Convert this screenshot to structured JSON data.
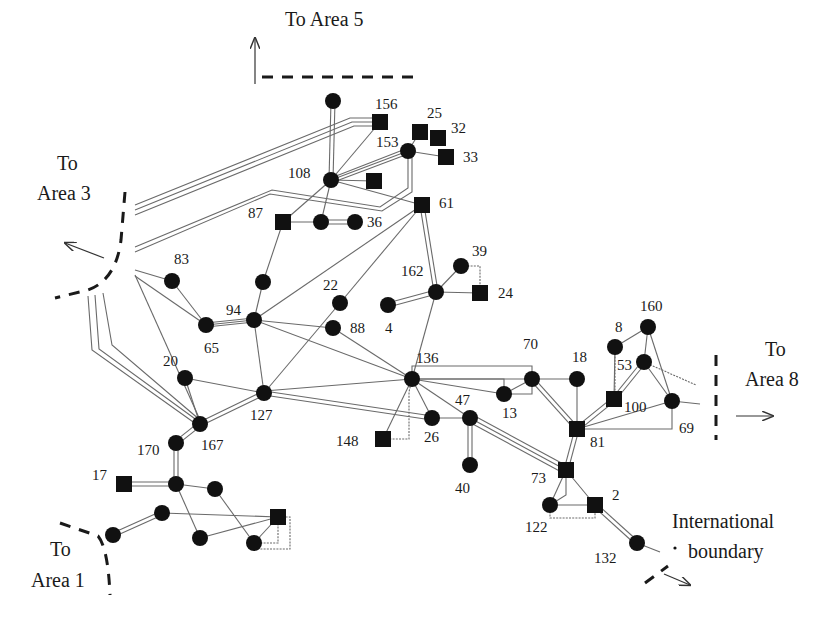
{
  "diagram": {
    "colors": {
      "node": "#111111",
      "line": "#6a6a6a",
      "boundary": "#1a1a1a"
    },
    "areas": [
      {
        "id": "area5",
        "label": "To Area 5",
        "x": 285,
        "y": 26
      },
      {
        "id": "area3",
        "line1": "To",
        "line2": "Area 3",
        "x": 70,
        "y1": 170,
        "y2": 200
      },
      {
        "id": "area8",
        "line1": "To",
        "line2": "Area 8",
        "x": 780,
        "y1": 355,
        "y2": 385
      },
      {
        "id": "area1",
        "line1": "To",
        "line2": "Area 1",
        "x": 65,
        "y1": 555,
        "y2": 585
      },
      {
        "id": "intl",
        "line1": "International",
        "line2": "boundary",
        "x": 765,
        "y1": 528,
        "y2": 558
      }
    ],
    "nodes": [
      {
        "id": "n-top",
        "label": "",
        "shape": "circle",
        "x": 333,
        "y": 101
      },
      {
        "id": "156",
        "label": "156",
        "shape": "square",
        "x": 380,
        "y": 122,
        "lx": 375,
        "ly": 109
      },
      {
        "id": "25",
        "label": "25",
        "shape": "square",
        "x": 420,
        "y": 132,
        "lx": 427,
        "ly": 118
      },
      {
        "id": "32",
        "label": "32",
        "shape": "square",
        "x": 438,
        "y": 138,
        "lx": 451,
        "ly": 133
      },
      {
        "id": "33",
        "label": "33",
        "shape": "square",
        "x": 446,
        "y": 157,
        "lx": 463,
        "ly": 162
      },
      {
        "id": "153",
        "label": "153",
        "shape": "circle",
        "x": 408,
        "y": 151,
        "lx": 376,
        "ly": 147
      },
      {
        "id": "108",
        "label": "108",
        "shape": "circle",
        "x": 331,
        "y": 180,
        "lx": 288,
        "ly": 178
      },
      {
        "id": "sq-108",
        "label": "",
        "shape": "square",
        "x": 374,
        "y": 181
      },
      {
        "id": "61",
        "label": "61",
        "shape": "square",
        "x": 422,
        "y": 205,
        "lx": 439,
        "ly": 208
      },
      {
        "id": "87",
        "label": "87",
        "shape": "square",
        "x": 283,
        "y": 222,
        "lx": 248,
        "ly": 218
      },
      {
        "id": "n-mid36",
        "label": "",
        "shape": "circle",
        "x": 321,
        "y": 222
      },
      {
        "id": "36",
        "label": "36",
        "shape": "circle",
        "x": 355,
        "y": 222,
        "lx": 367,
        "ly": 227
      },
      {
        "id": "83",
        "label": "83",
        "shape": "circle",
        "x": 172,
        "y": 281,
        "lx": 174,
        "ly": 264
      },
      {
        "id": "n-94top",
        "label": "",
        "shape": "circle",
        "x": 263,
        "y": 282
      },
      {
        "id": "94",
        "label": "94",
        "shape": "circle",
        "x": 254,
        "y": 320,
        "lx": 226,
        "ly": 315
      },
      {
        "id": "65",
        "label": "65",
        "shape": "circle",
        "x": 206,
        "y": 325,
        "lx": 204,
        "ly": 353
      },
      {
        "id": "22",
        "label": "22",
        "shape": "circle",
        "x": 340,
        "y": 303,
        "lx": 323,
        "ly": 290
      },
      {
        "id": "88",
        "label": "88",
        "shape": "circle",
        "x": 333,
        "y": 328,
        "lx": 350,
        "ly": 333
      },
      {
        "id": "39",
        "label": "39",
        "shape": "circle",
        "x": 461,
        "y": 266,
        "lx": 472,
        "ly": 256
      },
      {
        "id": "162",
        "label": "162",
        "shape": "circle",
        "x": 436,
        "y": 292,
        "lx": 401,
        "ly": 276
      },
      {
        "id": "24",
        "label": "24",
        "shape": "square",
        "x": 480,
        "y": 293,
        "lx": 498,
        "ly": 298
      },
      {
        "id": "4",
        "label": "4",
        "shape": "circle",
        "x": 388,
        "y": 305,
        "lx": 385,
        "ly": 333
      },
      {
        "id": "160",
        "label": "160",
        "shape": "circle",
        "x": 648,
        "y": 327,
        "lx": 640,
        "ly": 311
      },
      {
        "id": "8",
        "label": "8",
        "shape": "circle",
        "x": 615,
        "y": 347,
        "lx": 615,
        "ly": 332
      },
      {
        "id": "53",
        "label": "53",
        "shape": "circle",
        "x": 644,
        "y": 362,
        "lx": 617,
        "ly": 370
      },
      {
        "id": "20",
        "label": "20",
        "shape": "circle",
        "x": 185,
        "y": 378,
        "lx": 163,
        "ly": 366
      },
      {
        "id": "136",
        "label": "136",
        "shape": "circle",
        "x": 412,
        "y": 379,
        "lx": 416,
        "ly": 363
      },
      {
        "id": "70",
        "label": "70",
        "shape": "circle",
        "x": 532,
        "y": 379,
        "lx": 523,
        "ly": 349
      },
      {
        "id": "18",
        "label": "18",
        "shape": "circle",
        "x": 577,
        "y": 379,
        "lx": 572,
        "ly": 362
      },
      {
        "id": "13",
        "label": "13",
        "shape": "circle",
        "x": 504,
        "y": 394,
        "lx": 502,
        "ly": 418
      },
      {
        "id": "100",
        "label": "100",
        "shape": "square",
        "x": 614,
        "y": 399,
        "lx": 624,
        "ly": 412
      },
      {
        "id": "69",
        "label": "69",
        "shape": "circle",
        "x": 672,
        "y": 401,
        "lx": 679,
        "ly": 433
      },
      {
        "id": "127",
        "label": "127",
        "shape": "circle",
        "x": 264,
        "y": 393,
        "lx": 250,
        "ly": 420
      },
      {
        "id": "47",
        "label": "47",
        "shape": "circle",
        "x": 470,
        "y": 418,
        "lx": 455,
        "ly": 405
      },
      {
        "id": "26",
        "label": "26",
        "shape": "circle",
        "x": 432,
        "y": 418,
        "lx": 424,
        "ly": 442
      },
      {
        "id": "167",
        "label": "167",
        "shape": "circle",
        "x": 200,
        "y": 424,
        "lx": 201,
        "ly": 450
      },
      {
        "id": "81",
        "label": "81",
        "shape": "square",
        "x": 577,
        "y": 429,
        "lx": 590,
        "ly": 447
      },
      {
        "id": "148",
        "label": "148",
        "shape": "square",
        "x": 383,
        "y": 439,
        "lx": 336,
        "ly": 446
      },
      {
        "id": "170",
        "label": "170",
        "shape": "circle",
        "x": 176,
        "y": 443,
        "lx": 137,
        "ly": 455
      },
      {
        "id": "40",
        "label": "40",
        "shape": "circle",
        "x": 470,
        "y": 465,
        "lx": 455,
        "ly": 493
      },
      {
        "id": "73",
        "label": "73",
        "shape": "square",
        "x": 566,
        "y": 470,
        "lx": 531,
        "ly": 483
      },
      {
        "id": "17",
        "label": "17",
        "shape": "square",
        "x": 124,
        "y": 484,
        "lx": 92,
        "ly": 480
      },
      {
        "id": "n-17r",
        "label": "",
        "shape": "circle",
        "x": 176,
        "y": 484
      },
      {
        "id": "n-17rr",
        "label": "",
        "shape": "circle",
        "x": 215,
        "y": 489
      },
      {
        "id": "122",
        "label": "122",
        "shape": "circle",
        "x": 550,
        "y": 505,
        "lx": 525,
        "ly": 532
      },
      {
        "id": "2",
        "label": "2",
        "shape": "square",
        "x": 595,
        "y": 505,
        "lx": 612,
        "ly": 500
      },
      {
        "id": "n-a1",
        "label": "",
        "shape": "circle",
        "x": 162,
        "y": 513
      },
      {
        "id": "sq-a1",
        "label": "",
        "shape": "square",
        "x": 278,
        "y": 517
      },
      {
        "id": "n-a1l",
        "label": "",
        "shape": "circle",
        "x": 113,
        "y": 535
      },
      {
        "id": "n-a1b",
        "label": "",
        "shape": "circle",
        "x": 200,
        "y": 538
      },
      {
        "id": "n-a1br",
        "label": "",
        "shape": "circle",
        "x": 254,
        "y": 543
      },
      {
        "id": "132",
        "label": "132",
        "shape": "circle",
        "x": 637,
        "y": 543,
        "lx": 594,
        "ly": 563
      }
    ],
    "edges_single": [
      [
        "108",
        "153"
      ],
      [
        "108",
        "156"
      ],
      [
        "108",
        "61"
      ],
      [
        "108",
        "87"
      ],
      [
        "108",
        "n-mid36"
      ],
      [
        "108",
        "sq-108"
      ],
      [
        "153",
        "25"
      ],
      [
        "153",
        "33"
      ],
      [
        "87",
        "n-mid36"
      ],
      [
        "87",
        "n-94top"
      ],
      [
        "61",
        "94"
      ],
      [
        "61",
        "22"
      ],
      [
        "94",
        "88"
      ],
      [
        "94",
        "136"
      ],
      [
        "94",
        "127"
      ],
      [
        "94",
        "n-94top"
      ],
      [
        "83",
        "65"
      ],
      [
        "65",
        "94"
      ],
      [
        "22",
        "127"
      ],
      [
        "88",
        "136"
      ],
      [
        "162",
        "39"
      ],
      [
        "162",
        "24"
      ],
      [
        "162",
        "136"
      ],
      [
        "20",
        "127"
      ],
      [
        "20",
        "167"
      ],
      [
        "136",
        "26"
      ],
      [
        "136",
        "47"
      ],
      [
        "136",
        "13"
      ],
      [
        "136",
        "70"
      ],
      [
        "26",
        "47"
      ],
      [
        "70",
        "18"
      ],
      [
        "70",
        "13"
      ],
      [
        "18",
        "81"
      ],
      [
        "8",
        "160"
      ],
      [
        "8",
        "100"
      ],
      [
        "160",
        "53"
      ],
      [
        "160",
        "69"
      ],
      [
        "53",
        "69"
      ],
      [
        "81",
        "69"
      ],
      [
        "73",
        "2"
      ],
      [
        "73",
        "122"
      ],
      [
        "122",
        "2"
      ],
      [
        "n-17r",
        "n-17rr"
      ],
      [
        "n-17r",
        "n-a1b"
      ],
      [
        "n-17rr",
        "n-a1br"
      ],
      [
        "n-a1",
        "sq-a1"
      ],
      [
        "n-a1b",
        "sq-a1"
      ],
      [
        "n-a1br",
        "sq-a1"
      ],
      [
        "148",
        "136"
      ]
    ],
    "edges_double": [
      [
        "n-top",
        "108"
      ],
      [
        "162",
        "61"
      ],
      [
        "162",
        "4"
      ],
      [
        "n-mid36",
        "36"
      ],
      [
        "65",
        "94"
      ],
      [
        "167",
        "127"
      ],
      [
        "170",
        "167"
      ],
      [
        "170",
        "n-17r"
      ],
      [
        "17",
        "n-17r"
      ],
      [
        "47",
        "40"
      ],
      [
        "70",
        "81"
      ],
      [
        "81",
        "73"
      ],
      [
        "81",
        "100"
      ],
      [
        "100",
        "53"
      ],
      [
        "2",
        "132"
      ],
      [
        "n-a1l",
        "n-a1"
      ],
      [
        "127",
        "26"
      ]
    ],
    "edges_triple": [
      [
        "47",
        "73"
      ]
    ]
  }
}
